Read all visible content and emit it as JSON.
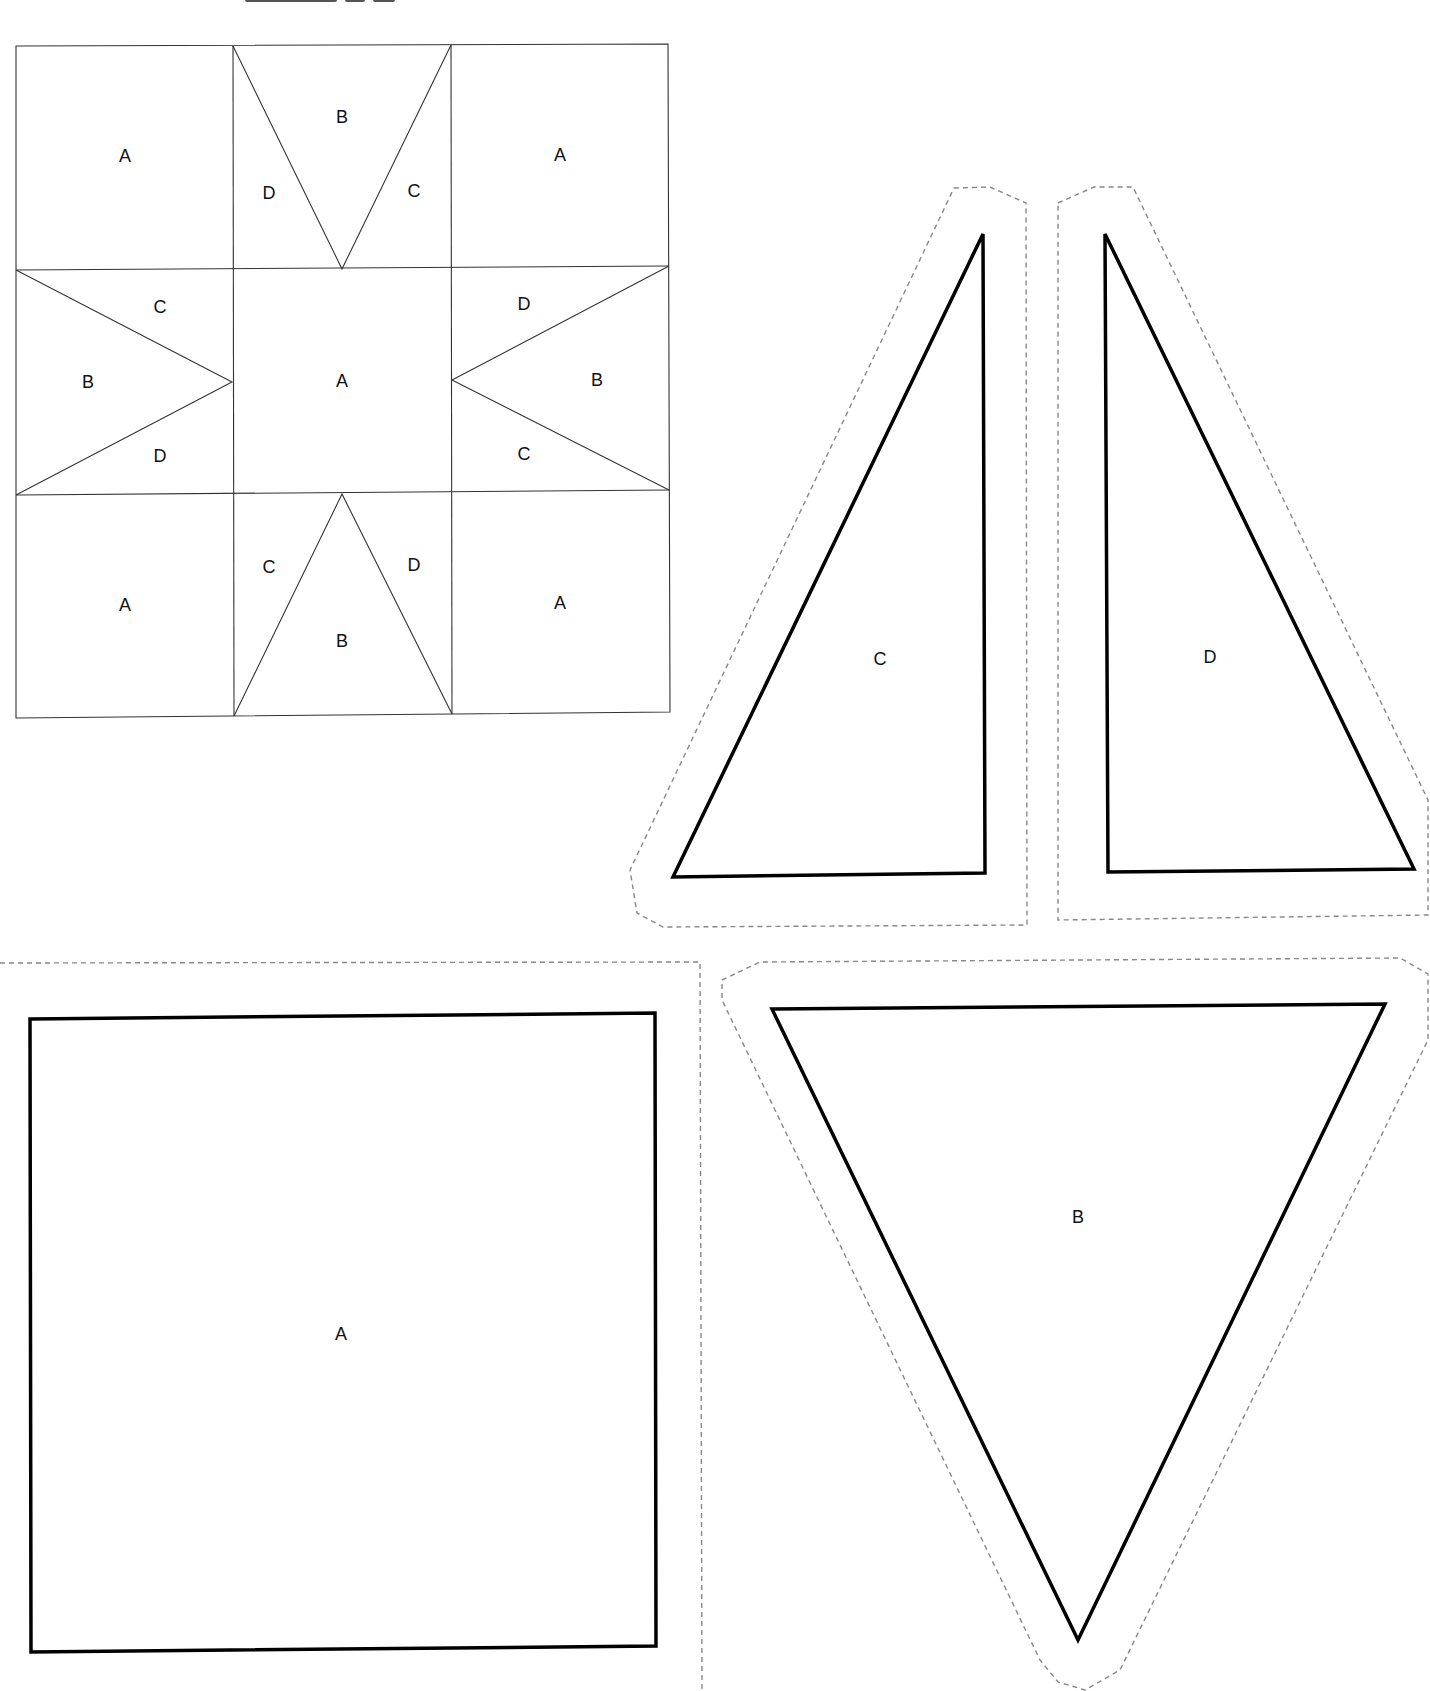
{
  "document": {
    "type": "quilt pattern template sheet",
    "colors": {
      "background": "#ffffff",
      "block_lines": "#333333",
      "cutting_lines": "#000000",
      "seam_allowance_lines": "#888888"
    }
  },
  "block_diagram": {
    "grid": "3x3",
    "cells": [
      {
        "row": 0,
        "col": 0,
        "labels": [
          "A"
        ]
      },
      {
        "row": 0,
        "col": 1,
        "labels": [
          "B",
          "D",
          "C"
        ]
      },
      {
        "row": 0,
        "col": 2,
        "labels": [
          "A"
        ]
      },
      {
        "row": 1,
        "col": 0,
        "labels": [
          "C",
          "B",
          "D"
        ]
      },
      {
        "row": 1,
        "col": 1,
        "labels": [
          "A"
        ]
      },
      {
        "row": 1,
        "col": 2,
        "labels": [
          "D",
          "B",
          "C"
        ]
      },
      {
        "row": 2,
        "col": 0,
        "labels": [
          "A"
        ]
      },
      {
        "row": 2,
        "col": 1,
        "labels": [
          "C",
          "D",
          "B"
        ]
      },
      {
        "row": 2,
        "col": 2,
        "labels": [
          "A"
        ]
      }
    ],
    "labels": {
      "tl_a": "A",
      "tc_b": "B",
      "tc_d": "D",
      "tc_c": "C",
      "tr_a": "A",
      "ml_c": "C",
      "ml_b": "B",
      "ml_d": "D",
      "mc_a": "A",
      "mr_d": "D",
      "mr_b": "B",
      "mr_c": "C",
      "bl_a": "A",
      "bc_c": "C",
      "bc_d": "D",
      "bc_b": "B",
      "br_a": "A"
    }
  },
  "templates": {
    "c": {
      "label": "C",
      "shape": "right triangle"
    },
    "d": {
      "label": "D",
      "shape": "right triangle (mirror of C)"
    },
    "a": {
      "label": "A",
      "shape": "square"
    },
    "b": {
      "label": "B",
      "shape": "isosceles triangle"
    }
  }
}
